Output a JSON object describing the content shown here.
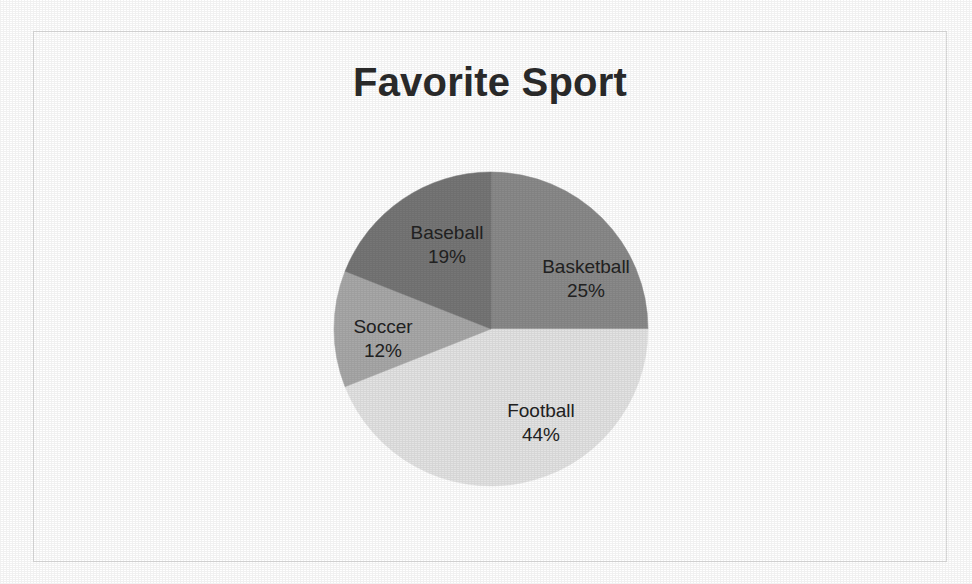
{
  "chart_data": {
    "type": "pie",
    "title": "Favorite Sport",
    "categories": [
      "Basketball",
      "Football",
      "Soccer",
      "Baseball"
    ],
    "values": [
      25,
      44,
      12,
      19
    ],
    "value_suffix": "%",
    "labels": [
      {
        "name": "Basketball",
        "value": 25,
        "value_text": "25%",
        "color": "#8a8a8a"
      },
      {
        "name": "Football",
        "value": 44,
        "value_text": "44%",
        "color": "#e3e3e3"
      },
      {
        "name": "Soccer",
        "value": 12,
        "value_text": "12%",
        "color": "#a8a8a8"
      },
      {
        "name": "Baseball",
        "value": 19,
        "value_text": "19%",
        "color": "#767676"
      }
    ],
    "start_angle_deg": 0,
    "direction": "clockwise",
    "labels_position": "inside-slices",
    "legend": "none",
    "grid": false,
    "xlabel": "",
    "ylabel": ""
  },
  "frame": {
    "border_color": "#dcdcdc",
    "background": "#ffffff"
  },
  "title": {
    "text": "Favorite Sport",
    "color": "#2b2b2b"
  }
}
